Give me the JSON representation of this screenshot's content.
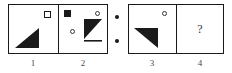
{
  "figure": {
    "type": "visual-analogy-puzzle",
    "separator": {
      "name": "proportion-dots",
      "glyph": "::",
      "dot_count": 2,
      "color": "#1a1a1a"
    },
    "panels": [
      {
        "number": "1",
        "label": "1",
        "group": "left",
        "shapes": [
          {
            "name": "open-square",
            "kind": "square",
            "fill": "white",
            "stroke": "#1a1a1a",
            "position": "top-right"
          },
          {
            "name": "black-triangle",
            "kind": "triangle",
            "fill": "#1a1a1a",
            "orientation": "right-angle-bottom-left-pointing-up-right",
            "position": "bottom-left"
          }
        ]
      },
      {
        "number": "2",
        "label": "2",
        "group": "left",
        "shapes": [
          {
            "name": "filled-square",
            "kind": "square",
            "fill": "#1a1a1a",
            "stroke": "#1a1a1a",
            "position": "top-left"
          },
          {
            "name": "open-circle-left",
            "kind": "circle",
            "fill": "white",
            "stroke": "#333333",
            "position": "middle-left"
          },
          {
            "name": "open-circle-top",
            "kind": "circle",
            "fill": "white",
            "stroke": "#333333",
            "position": "top-right"
          },
          {
            "name": "black-triangle",
            "kind": "triangle",
            "fill": "#1a1a1a",
            "orientation": "right-angle-top-left-pointing-down-right",
            "position": "right"
          }
        ]
      },
      {
        "number": "3",
        "label": "3",
        "group": "right",
        "shapes": [
          {
            "name": "open-circle",
            "kind": "circle",
            "fill": "white",
            "stroke": "#333333",
            "position": "top-right"
          },
          {
            "name": "black-triangle",
            "kind": "triangle",
            "fill": "#1a1a1a",
            "orientation": "right-angle-top-left-pointing-down-left",
            "position": "bottom-left"
          }
        ]
      },
      {
        "number": "4",
        "label": "4",
        "group": "right",
        "shapes": [
          {
            "name": "question-mark",
            "kind": "text",
            "value": "?",
            "color": "#333333",
            "position": "center"
          }
        ],
        "answer_placeholder": "?"
      }
    ],
    "colors": {
      "ink": "#1a1a1a",
      "outline": "#333333",
      "paper": "#ffffff",
      "label_text": "#4a4a4a"
    }
  }
}
